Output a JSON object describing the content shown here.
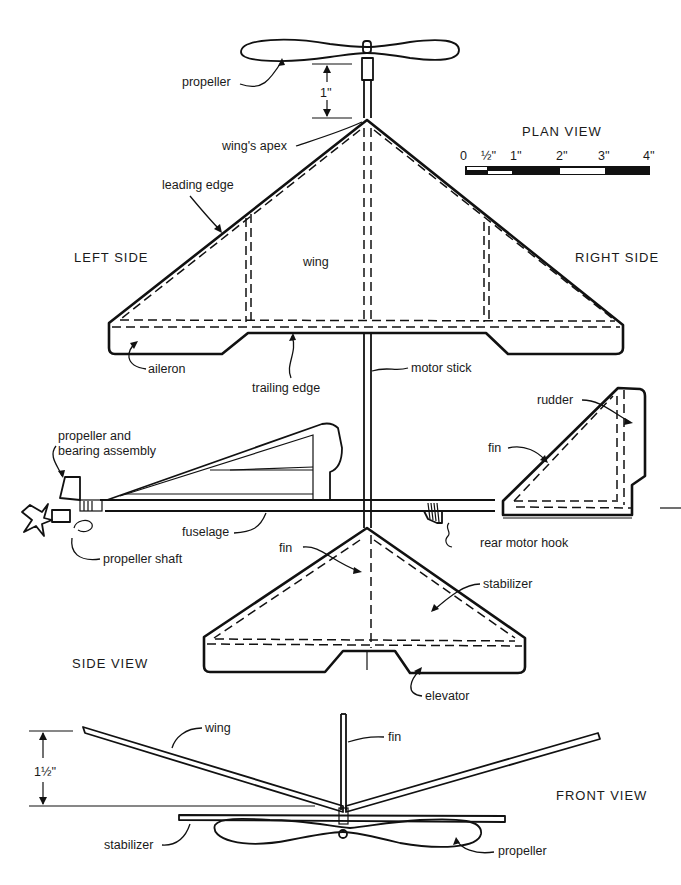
{
  "figure": {
    "views": {
      "plan": {
        "title": "PLAN VIEW",
        "scale_bar": {
          "ticks": [
            "0",
            "½''",
            "1''",
            "2''",
            "3''",
            "4''"
          ]
        },
        "side_labels": {
          "left": "LEFT SIDE",
          "right": "RIGHT SIDE"
        },
        "dimension": "1''",
        "labels": {
          "propeller": "propeller",
          "wings_apex": "wing's apex",
          "leading_edge": "leading edge",
          "wing": "wing",
          "aileron": "aileron",
          "trailing_edge": "trailing edge",
          "motor_stick": "motor stick",
          "fin": "fin",
          "stabilizer": "stabilizer",
          "elevator": "elevator"
        }
      },
      "side": {
        "title": "SIDE VIEW",
        "labels": {
          "propeller_assembly_1": "propeller and",
          "propeller_assembly_2": "bearing assembly",
          "fuselage": "fuselage",
          "propeller_shaft": "propeller shaft",
          "rear_motor_hook": "rear motor hook",
          "rudder": "rudder",
          "fin": "fin"
        }
      },
      "front": {
        "title": "FRONT VIEW",
        "dimension": "1½''",
        "labels": {
          "wing": "wing",
          "fin": "fin",
          "stabilizer": "stabilizer",
          "propeller": "propeller"
        }
      }
    }
  }
}
